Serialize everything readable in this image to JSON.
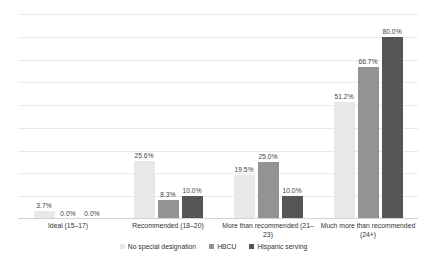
{
  "chart_data": {
    "type": "bar",
    "title": "",
    "subtitle": "",
    "xlabel": "",
    "ylabel": "",
    "ylim": [
      0,
      90
    ],
    "grid": true,
    "gridline_count": 9,
    "legend_position": "bottom",
    "value_label_format": "percent-one-decimal",
    "categories": [
      "Ideal (15–17)",
      "Recommended (18–20)",
      "More than recommended (21–23)",
      "Much more than recommended (24+)"
    ],
    "series": [
      {
        "name": "No special designation",
        "color": "#e8e8e8",
        "values": [
          3.7,
          25.6,
          19.5,
          51.2
        ],
        "labels": [
          "3.7%",
          "25.6%",
          "19.5%",
          "51.2%"
        ]
      },
      {
        "name": "HBCU",
        "color": "#939393",
        "values": [
          0.0,
          8.3,
          25.0,
          66.7
        ],
        "labels": [
          "0.0%",
          "8.3%",
          "25.0%",
          "66.7%"
        ]
      },
      {
        "name": "Hispanic serving",
        "color": "#555555",
        "values": [
          0.0,
          10.0,
          10.0,
          80.0
        ],
        "labels": [
          "0.0%",
          "10.0%",
          "10.0%",
          "80.0%"
        ]
      }
    ]
  },
  "colors": {
    "background": "#ffffff",
    "gridline": "#e9e9e9",
    "axis": "#d2d2d2",
    "text": "#333333"
  }
}
